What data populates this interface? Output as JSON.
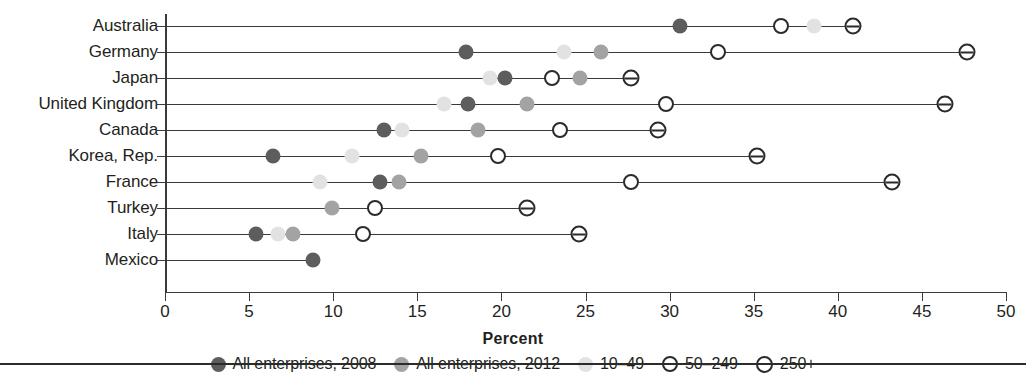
{
  "chart_data": {
    "type": "scatter",
    "title": "",
    "xlabel": "Percent",
    "ylabel": "",
    "xlim": [
      0,
      50
    ],
    "xticks": [
      0,
      5,
      10,
      15,
      20,
      25,
      30,
      35,
      40,
      45,
      50
    ],
    "xticklabels": [
      "0",
      "5",
      "10",
      "15",
      "20",
      "25",
      "30",
      "35",
      "40",
      "45",
      "50"
    ],
    "grid": false,
    "legend_position": "bottom",
    "categories": [
      "Australia",
      "Germany",
      "Japan",
      "United Kingdom",
      "Canada",
      "Korea, Rep.",
      "France",
      "Turkey",
      "Italy",
      "Mexico"
    ],
    "series": [
      {
        "name": "All enterprises, 2008",
        "marker": "filled-dark-circle",
        "color": "#5d5d5d",
        "values": [
          30.6,
          17.9,
          20.2,
          18.0,
          13.0,
          6.4,
          12.8,
          null,
          5.4,
          8.8
        ]
      },
      {
        "name": "All enterprises, 2012",
        "marker": "filled-mid-circle",
        "color": "#a3a3a3",
        "values": [
          null,
          25.9,
          24.7,
          21.5,
          18.6,
          15.2,
          13.9,
          9.9,
          7.6,
          null
        ]
      },
      {
        "name": "10–49",
        "marker": "filled-light-circle",
        "color": "#e2e2e2",
        "values": [
          38.6,
          23.7,
          19.3,
          16.6,
          14.1,
          11.1,
          9.2,
          null,
          6.7,
          null
        ]
      },
      {
        "name": "50–249",
        "marker": "open-circle",
        "color": "#2b2b2b",
        "values": [
          36.6,
          32.9,
          23.0,
          29.8,
          23.5,
          19.8,
          27.7,
          12.5,
          11.8,
          null
        ]
      },
      {
        "name": "250+",
        "marker": "barred-circle",
        "color": "#2b2b2b",
        "values": [
          40.9,
          47.7,
          27.7,
          46.4,
          29.3,
          35.2,
          43.2,
          21.5,
          24.6,
          null
        ]
      }
    ]
  },
  "axis": {
    "xlabel": "Percent"
  },
  "legend": {
    "items": [
      {
        "label": "All enterprises, 2008",
        "marker": "filled-dark-circle"
      },
      {
        "label": "All enterprises, 2012",
        "marker": "filled-mid-circle"
      },
      {
        "label": "10–49",
        "marker": "filled-light-circle"
      },
      {
        "label": "50–249",
        "marker": "open-circle"
      },
      {
        "label": "250+",
        "marker": "barred-circle"
      }
    ]
  }
}
